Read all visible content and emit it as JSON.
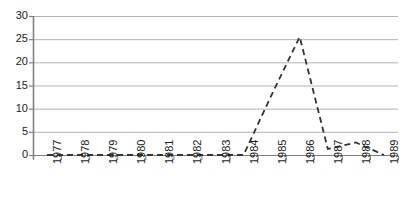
{
  "chart_data": {
    "type": "line",
    "title": "",
    "subtitle": "",
    "xlabel": "",
    "ylabel": "",
    "categories": [
      "1977",
      "1978",
      "1979",
      "1980",
      "1981",
      "1982",
      "1983",
      "1984",
      "1985",
      "1986",
      "1987",
      "1988",
      "1989"
    ],
    "values": [
      0,
      0,
      0,
      0,
      0,
      0,
      0,
      0,
      13,
      25.5,
      1.3,
      2.7,
      0
    ],
    "series": [
      {
        "name": "series-1",
        "values": [
          0,
          0,
          0,
          0,
          0,
          0,
          0,
          0,
          13,
          25.5,
          1.3,
          2.7,
          0
        ],
        "line_style": "dashed",
        "color": "#333333",
        "markers": false
      }
    ],
    "ylim": [
      0,
      30
    ],
    "yticks": [
      0,
      5,
      10,
      15,
      20,
      25,
      30
    ],
    "ytick_labels": [
      "0",
      "5",
      "10",
      "15",
      "20",
      "25",
      "30"
    ],
    "xtick_labels": [
      "1977",
      "1978",
      "1979",
      "1980",
      "1981",
      "1982",
      "1983",
      "1984",
      "1985",
      "1986",
      "1987",
      "1988",
      "1989"
    ],
    "xtick_rotation": -90,
    "grid": {
      "horizontal": true,
      "vertical": false,
      "color": "#b3b3b3"
    },
    "legend": {
      "visible": false,
      "position": "none",
      "entries": []
    },
    "axis": {
      "color": "#808080",
      "left_spine": true,
      "bottom_spine": true,
      "top_spine": false,
      "right_spine": false
    },
    "annotations": []
  },
  "colors": {
    "background": "#ffffff",
    "gridline": "#b3b3b3",
    "axis": "#808080",
    "series": "#333333",
    "text": "#1a1a1a"
  }
}
